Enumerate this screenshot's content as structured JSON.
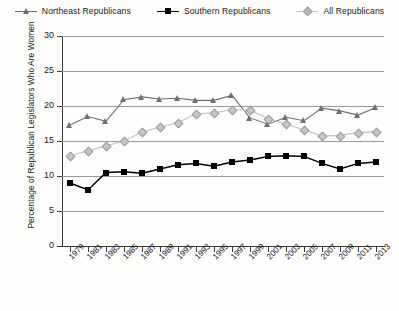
{
  "chart_data": {
    "type": "line",
    "title": "",
    "xlabel": "",
    "ylabel": "Percentage of Republican Legislators Who Are Women",
    "ylim": [
      0,
      30
    ],
    "yticks": [
      0,
      5,
      10,
      15,
      20,
      25,
      30
    ],
    "grid": true,
    "legend_position": "top-center",
    "x": [
      1979,
      1981,
      1983,
      1985,
      1987,
      1989,
      1991,
      1993,
      1995,
      1997,
      1999,
      2001,
      2003,
      2005,
      2007,
      2009,
      2011,
      2013
    ],
    "categories": [
      "1979",
      "1981",
      "1983",
      "1985",
      "1987",
      "1989",
      "1991",
      "1993",
      "1995",
      "1997",
      "1999",
      "2001",
      "2003",
      "2005",
      "2007",
      "2009",
      "2011",
      "2013"
    ],
    "series": [
      {
        "name": "Northeast Republicans",
        "marker": "triangle",
        "color": "#6f6f6f",
        "values": [
          17.3,
          18.5,
          17.8,
          20.9,
          21.3,
          21.0,
          21.1,
          20.8,
          20.8,
          21.5,
          18.3,
          17.4,
          18.4,
          17.9,
          19.7,
          19.3,
          18.7,
          19.8
        ]
      },
      {
        "name": "Southern Republicans",
        "marker": "square",
        "color": "#000000",
        "values": [
          9.0,
          8.0,
          10.5,
          10.6,
          10.4,
          11.0,
          11.6,
          11.8,
          11.4,
          12.0,
          12.3,
          12.8,
          12.9,
          12.8,
          11.8,
          11.0,
          11.8,
          12.0
        ]
      },
      {
        "name": "All Republicans",
        "marker": "diamond",
        "color": "#bdbdbd",
        "values": [
          12.9,
          13.6,
          14.3,
          15.0,
          16.3,
          17.0,
          17.6,
          18.9,
          19.0,
          19.5,
          19.4,
          18.2,
          17.4,
          16.6,
          15.7,
          15.8,
          16.2,
          16.3
        ]
      }
    ]
  },
  "legend": {
    "items": [
      {
        "label": "Northeast Republicans",
        "marker": "triangle-marker"
      },
      {
        "label": "Southern Republicans",
        "marker": "square-marker"
      },
      {
        "label": "All Republicans",
        "marker": "diamond-marker"
      }
    ]
  }
}
